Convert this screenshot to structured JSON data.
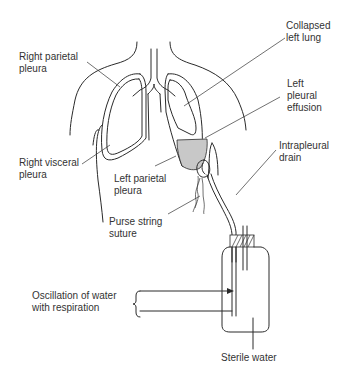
{
  "labels": {
    "right_parietal_pleura": "Right parietal\npleura",
    "right_visceral_pleura": "Right visceral\npleura",
    "left_parietal_pleura": "Left parietal\npleura",
    "purse_string_suture": "Purse string\nsuture",
    "collapsed_left_lung": "Collapsed\nleft lung",
    "left_pleural_effusion": "Left\npleural\neffusion",
    "intrapleural_drain": "Intrapleural\ndrain",
    "oscillation": "Oscillation of water\nwith respiration",
    "sterile_water": "Sterile water"
  },
  "colors": {
    "line": "#2a2a2a",
    "effusion_fill": "#c8c8c8",
    "text": "#333333",
    "background": "#ffffff"
  }
}
